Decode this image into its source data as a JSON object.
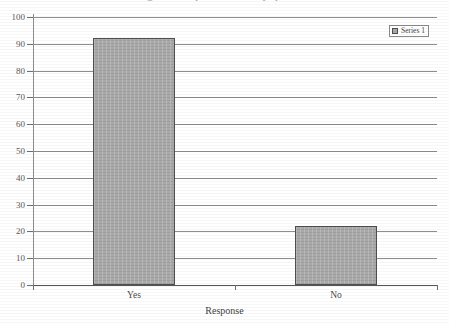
{
  "title_ghost": "Figure - Response to survey question",
  "chart_data": {
    "type": "bar",
    "title": "",
    "xlabel": "Response",
    "ylabel": "",
    "categories": [
      "Yes",
      "No"
    ],
    "values": [
      92,
      22
    ],
    "series": [
      {
        "name": "Series 1",
        "values": [
          92,
          22
        ]
      }
    ],
    "ylim": [
      0,
      100
    ],
    "ytick_step": 10,
    "yticks": [
      0,
      10,
      20,
      30,
      40,
      50,
      60,
      70,
      80,
      90,
      100
    ],
    "ytick_labels": [
      "0",
      "10",
      "20",
      "30",
      "40",
      "50",
      "60",
      "70",
      "80",
      "90",
      "100"
    ],
    "grid": true,
    "grid_axis": "y",
    "legend": {
      "visible": true,
      "position": "top-right",
      "entries": [
        {
          "label": "Series 1",
          "color": "#a9a9a9"
        }
      ]
    },
    "bar_color": "#a9a9a9",
    "bar_border_color": "#4f4f4f",
    "axis_color": "#8d8d8d",
    "text_color": "#4a4a4a",
    "background": "#ffffff"
  }
}
